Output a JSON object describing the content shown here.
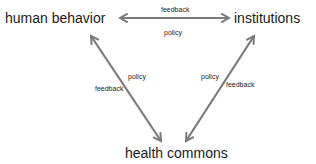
{
  "diagram": {
    "nodes": {
      "human_behavior": "human behavior",
      "institutions": "institutions",
      "health_commons": "health commons"
    },
    "edges": {
      "top": {
        "label_above": "feedback",
        "label_below": "policy"
      },
      "left": {
        "label_right": "policy",
        "label_left": "feedback"
      },
      "right": {
        "label_left": "policy",
        "label_right": "feedback"
      }
    },
    "colors": {
      "arrow": "#7a7a7a",
      "text": "#1a1a1a"
    }
  }
}
